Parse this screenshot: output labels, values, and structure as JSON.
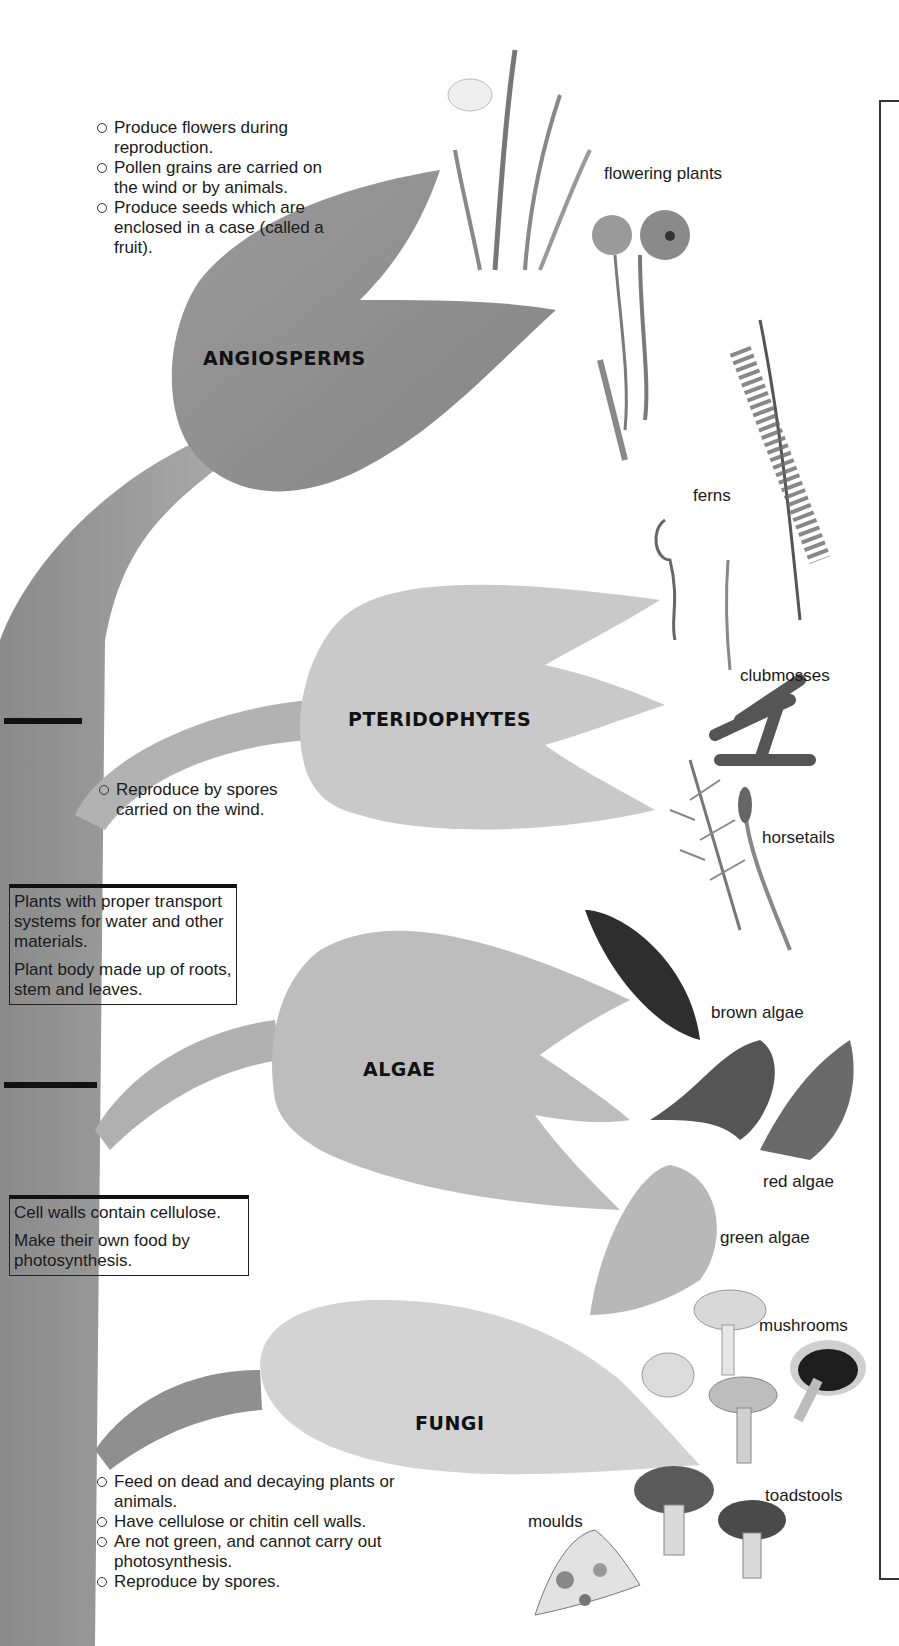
{
  "diagram": {
    "type": "classification-tree",
    "groups": [
      {
        "name": "ANGIOSPERMS",
        "features": [
          "Produce flowers during reproduction.",
          "Pollen grains are carried on the wind or by animals.",
          "Produce seeds which are enclosed in a case (called a fruit)."
        ],
        "examples": [
          "flowering plants"
        ]
      },
      {
        "name": "PTERIDOPHYTES",
        "features": [
          "Reproduce by spores carried on the wind."
        ],
        "examples": [
          "ferns",
          "clubmosses",
          "horsetails"
        ]
      },
      {
        "name": "ALGAE",
        "features": [],
        "examples": [
          "brown algae",
          "red algae",
          "green algae"
        ]
      },
      {
        "name": "FUNGI",
        "features": [
          "Feed on dead and decaying plants or animals.",
          "Have cellulose or chitin cell walls.",
          "Are not green, and cannot carry out photosynthesis.",
          "Reproduce by spores."
        ],
        "examples": [
          "mushrooms",
          "toadstools",
          "moulds"
        ]
      }
    ],
    "branch_boxes": [
      {
        "lines": [
          "Plants with proper transport systems for water and other materials.",
          "Plant body made up of roots, stem and leaves."
        ]
      },
      {
        "lines": [
          "Cell walls contain cellulose.",
          "Make their own food by photosynthesis."
        ]
      }
    ]
  },
  "colors": {
    "angiosperms_fill": "#8e8e8e",
    "pteridophytes_fill": "#c9c9c9",
    "algae_fill": "#bdbdbd",
    "fungi_fill": "#d3d3d3",
    "trunk_fill": "#9a9a9a",
    "ink": "#111111"
  }
}
